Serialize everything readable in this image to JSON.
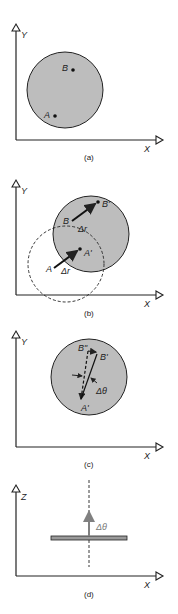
{
  "colors": {
    "line": "#222222",
    "disk_fill": "#bdbdbd",
    "arrow_gray": "#808080"
  },
  "panels": [
    {
      "id": "a",
      "caption": "(a)",
      "axes": {
        "vertical": "Y",
        "horizontal": "X"
      },
      "points": [
        {
          "label": "B"
        },
        {
          "label": "A"
        }
      ]
    },
    {
      "id": "b",
      "caption": "(b)",
      "axes": {
        "vertical": "Y",
        "horizontal": "X"
      },
      "points": [
        {
          "label": "B"
        },
        {
          "label": "B'"
        },
        {
          "label": "A"
        },
        {
          "label": "A'"
        }
      ],
      "displacement_labels": [
        "Δr",
        "Δr"
      ]
    },
    {
      "id": "c",
      "caption": "(c)",
      "axes": {
        "vertical": "Y",
        "horizontal": "X"
      },
      "points": [
        {
          "label": "B\""
        },
        {
          "label": "B'"
        },
        {
          "label": "A'"
        }
      ],
      "angle_label": "Δθ"
    },
    {
      "id": "d",
      "caption": "(d)",
      "axes": {
        "vertical": "Z",
        "horizontal": "X"
      },
      "angle_label": "Δθ"
    }
  ]
}
